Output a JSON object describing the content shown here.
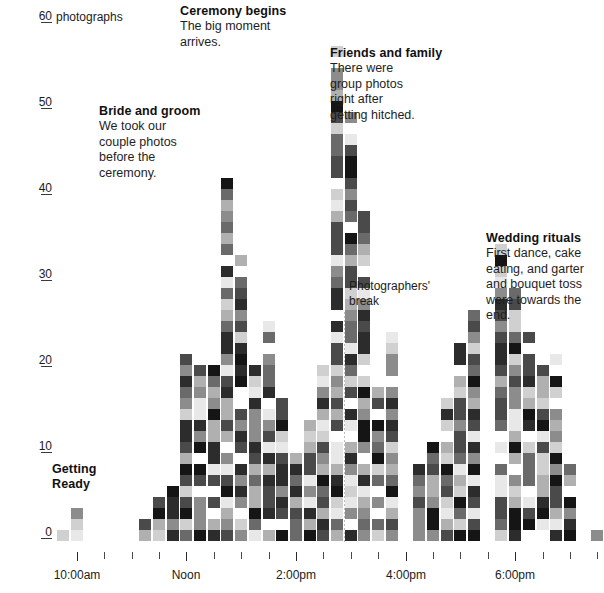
{
  "chart_data": {
    "type": "bar",
    "title": "",
    "xlabel": "",
    "ylabel": "photographs",
    "y_unit_label": "photographs",
    "ylim": [
      0,
      61
    ],
    "yticks": [
      0,
      10,
      20,
      30,
      40,
      50,
      60
    ],
    "ytick_labels": [
      "0",
      "10",
      "20",
      "30",
      "40",
      "50",
      "60"
    ],
    "xlim_labels": [
      "10:00am",
      "Noon",
      "2:00pm",
      "4:00pm",
      "6:00pm",
      "8:00pm"
    ],
    "x_major_ticks": [
      "10:00am",
      "Noon",
      "2:00pm",
      "4:00pm",
      "6:00pm",
      "8:00pm"
    ],
    "grid": false,
    "legend": "none",
    "bin_minutes": 15,
    "unit_note": "each cell = 1 photograph, shaded randomly in grayscale",
    "categories": [
      "9:45am",
      "10:00am",
      "10:15am",
      "10:30am",
      "10:45am",
      "11:00am",
      "11:15am",
      "11:30am",
      "11:45am",
      "Noon",
      "12:15pm",
      "12:30pm",
      "12:45pm",
      "1:00pm",
      "1:15pm",
      "1:30pm",
      "1:45pm",
      "2:00pm",
      "2:15pm",
      "2:30pm",
      "2:45pm",
      "3:00pm",
      "3:15pm",
      "3:30pm",
      "3:45pm",
      "4:00pm",
      "4:15pm",
      "4:30pm",
      "4:45pm",
      "5:00pm",
      "5:15pm",
      "5:30pm",
      "5:45pm",
      "6:00pm",
      "6:15pm",
      "6:30pm",
      "6:45pm",
      "7:00pm",
      "7:15pm",
      "7:30pm",
      "7:45pm",
      "8:00pm"
    ],
    "values": [
      3,
      4,
      0,
      1,
      0,
      0,
      2,
      5,
      7,
      23,
      21,
      20,
      42,
      33,
      22,
      25,
      17,
      11,
      14,
      20,
      58,
      50,
      38,
      18,
      24,
      0,
      9,
      12,
      17,
      23,
      28,
      0,
      35,
      29,
      24,
      20,
      22,
      9,
      0,
      1,
      0,
      0
    ]
  },
  "axis": {
    "y_top_label": "60",
    "y_unit": "photographs",
    "ticks": [
      {
        "label": "60",
        "value": 60
      },
      {
        "label": "50",
        "value": 50
      },
      {
        "label": "40",
        "value": 40
      },
      {
        "label": "30",
        "value": 30
      },
      {
        "label": "20",
        "value": 20
      },
      {
        "label": "10",
        "value": 10
      },
      {
        "label": "0",
        "value": 0
      }
    ],
    "x_labels": [
      {
        "label": "10:00am"
      },
      {
        "label": "Noon"
      },
      {
        "label": "2:00pm"
      },
      {
        "label": "4:00pm"
      },
      {
        "label": "6:00pm"
      },
      {
        "label": "8:00pm"
      }
    ]
  },
  "annotations": [
    {
      "id": "getting-ready",
      "heading": "Getting\nReady",
      "heading_lines": [
        "Getting",
        "Ready"
      ],
      "body_lines": []
    },
    {
      "id": "bride-and-groom",
      "heading": "Bride and groom",
      "body_lines": [
        "We took our",
        "couple photos",
        "before the",
        "ceremony."
      ]
    },
    {
      "id": "ceremony-begins",
      "heading": "Ceremony begins",
      "body_lines": [
        "The big moment",
        "arrives."
      ]
    },
    {
      "id": "friends-and-family",
      "heading": "Friends and family",
      "body_lines": [
        "There were",
        "group photos",
        "right after",
        "getting hitched."
      ]
    },
    {
      "id": "wedding-rituals",
      "heading": "Wedding rituals",
      "body_lines": [
        "First dance, cake",
        "eating, and garter",
        "and bouquet toss",
        "were towards the",
        "end."
      ]
    },
    {
      "id": "photographers-break",
      "heading": "",
      "body_lines": [
        "Photographers'",
        "break"
      ]
    }
  ],
  "labels": {
    "getting_ready_l1": "Getting",
    "getting_ready_l2": "Ready",
    "bride_hd": "Bride and groom",
    "bride_b1": "We took our",
    "bride_b2": "couple photos",
    "bride_b3": "before the",
    "bride_b4": "ceremony.",
    "ceremony_hd": "Ceremony begins",
    "ceremony_b1": "The big moment",
    "ceremony_b2": "arrives.",
    "friends_hd": "Friends and family",
    "friends_b1": "There were",
    "friends_b2": "group photos",
    "friends_b3": "right after",
    "friends_b4": "getting hitched.",
    "rituals_hd": "Wedding rituals",
    "rituals_b1": "First dance, cake",
    "rituals_b2": "eating, and garter",
    "rituals_b3": "and bouquet toss",
    "rituals_b4": "were towards the",
    "rituals_b5": "end.",
    "break_b1": "Photographers'",
    "break_b2": "break",
    "y_unit": "photographs",
    "y60": "60",
    "y50": "50",
    "y40": "40",
    "y30": "30",
    "y20": "20",
    "y10": "10",
    "y0": "0",
    "x1": "10:00am",
    "x2": "Noon",
    "x3": "2:00pm",
    "x4": "4:00pm",
    "x5": "6:00pm",
    "x6": "8:00pm"
  },
  "colors": {
    "background": "#ffffff",
    "text": "#1b1b1b",
    "axis": "#3a3a3a",
    "cell_palette": [
      "#ffffff",
      "#e8e8e8",
      "#d0d0d0",
      "#b0b0b0",
      "#8c8c8c",
      "#6a6a6a",
      "#4a4a4a",
      "#2c2c2c",
      "#151515"
    ]
  }
}
